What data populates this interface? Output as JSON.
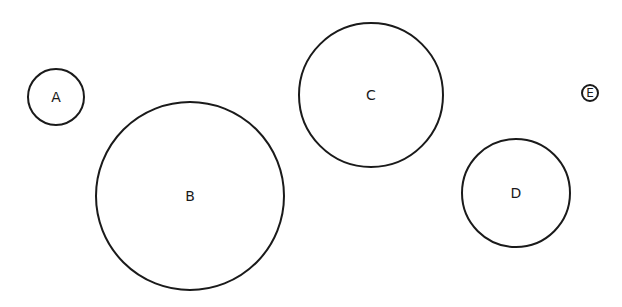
{
  "diagram": {
    "circles": [
      {
        "label": "A",
        "cx": 56,
        "cy": 97,
        "r": 29
      },
      {
        "label": "B",
        "cx": 190,
        "cy": 196,
        "r": 95
      },
      {
        "label": "C",
        "cx": 371,
        "cy": 95,
        "r": 73
      },
      {
        "label": "D",
        "cx": 516,
        "cy": 193,
        "r": 55
      },
      {
        "label": "E",
        "cx": 590,
        "cy": 93,
        "r": 9
      }
    ],
    "stroke_color": "#1a1a1a",
    "background": "#ffffff"
  }
}
